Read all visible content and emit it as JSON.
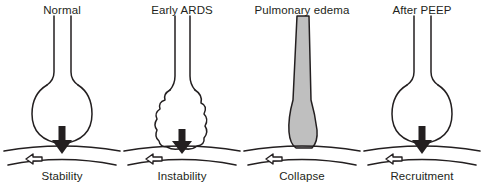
{
  "figure": {
    "background_color": "#ffffff",
    "ink_color": "#231f20",
    "edema_fill_color": "#bfbfbf",
    "panel_count": 4
  },
  "legend": {
    "down_arrow_name": "downward-compression-arrow",
    "side_arrow_name": "hollow-lateral-traction-arrow",
    "airway_name": "airway-duct",
    "alveolus_name": "alveolus-sac",
    "basement_name": "basement-membrane-curve"
  },
  "panels": [
    {
      "id": "normal",
      "top_label": "Normal",
      "bottom_label": "Stability",
      "alveolus_shape": "round-open",
      "filled": false,
      "has_down_arrow": true,
      "has_side_arrow": true
    },
    {
      "id": "early-ards",
      "top_label": "Early ARDS",
      "bottom_label": "Instability",
      "alveolus_shape": "irregular-teardrop",
      "filled": false,
      "has_down_arrow": true,
      "has_side_arrow": true
    },
    {
      "id": "pulmonary-edema",
      "top_label": "Pulmonary edema",
      "bottom_label": "Collapse",
      "alveolus_shape": "fluid-filled-column",
      "filled": true,
      "has_down_arrow": false,
      "has_side_arrow": true
    },
    {
      "id": "after-peep",
      "top_label": "After PEEP",
      "bottom_label": "Recruitment",
      "alveolus_shape": "round-open",
      "filled": false,
      "has_down_arrow": true,
      "has_side_arrow": true
    }
  ]
}
